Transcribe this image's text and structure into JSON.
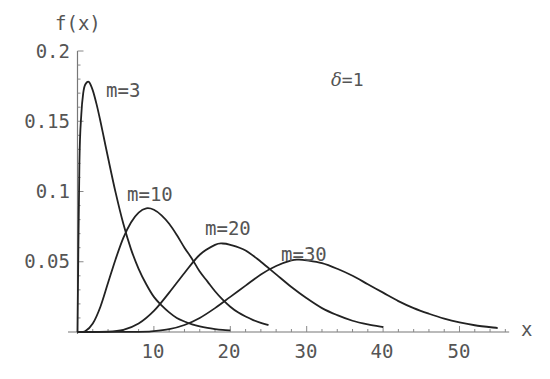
{
  "chart_data": {
    "type": "line",
    "title": "",
    "xlabel": "x",
    "ylabel": "f(x)",
    "xlim": [
      0,
      57
    ],
    "ylim": [
      0,
      0.2
    ],
    "grid": false,
    "legend": "inline curve labels",
    "x_ticks": [
      10,
      20,
      30,
      40,
      50
    ],
    "x_tick_labels": [
      "10",
      "20",
      "30",
      "40",
      "50"
    ],
    "y_ticks": [
      0.05,
      0.1,
      0.15,
      0.2
    ],
    "y_tick_labels": [
      "0.05",
      "0.1",
      "0.15",
      "0.2"
    ],
    "annotations": [
      {
        "text": "δ=1",
        "x": 36,
        "y": 0.178
      }
    ],
    "series": [
      {
        "name": "m=3",
        "label_pos": {
          "x": 3.8,
          "y": 0.172
        },
        "x": [
          0,
          0.25,
          0.5,
          0.75,
          1,
          1.5,
          2,
          2.5,
          3,
          3.5,
          4,
          5,
          6,
          7,
          8,
          9,
          10,
          11,
          12,
          13,
          14,
          15,
          16,
          17,
          18,
          19,
          20
        ],
        "values": [
          0,
          0.12,
          0.155,
          0.17,
          0.176,
          0.178,
          0.172,
          0.162,
          0.15,
          0.137,
          0.124,
          0.099,
          0.077,
          0.059,
          0.045,
          0.034,
          0.025,
          0.019,
          0.014,
          0.01,
          0.0075,
          0.0055,
          0.004,
          0.0029,
          0.0021,
          0.0015,
          0.0011
        ]
      },
      {
        "name": "m=10",
        "label_pos": {
          "x": 6.5,
          "y": 0.098
        },
        "x": [
          0,
          1,
          2,
          3,
          4,
          5,
          6,
          7,
          8,
          9,
          10,
          11,
          12,
          13,
          14,
          15,
          16,
          17,
          18,
          19,
          20,
          21,
          22,
          23,
          24,
          25
        ],
        "values": [
          0,
          0.0005,
          0.006,
          0.018,
          0.035,
          0.052,
          0.067,
          0.078,
          0.085,
          0.088,
          0.087,
          0.083,
          0.077,
          0.069,
          0.06,
          0.052,
          0.043,
          0.036,
          0.029,
          0.023,
          0.018,
          0.014,
          0.011,
          0.0085,
          0.0065,
          0.0049
        ]
      },
      {
        "name": "m=20",
        "label_pos": {
          "x": 16.8,
          "y": 0.07
        },
        "x": [
          0,
          4,
          6,
          8,
          10,
          12,
          14,
          16,
          18,
          19,
          20,
          22,
          24,
          26,
          28,
          30,
          32,
          34,
          36,
          38,
          40
        ],
        "values": [
          0,
          0.0002,
          0.0015,
          0.006,
          0.015,
          0.028,
          0.042,
          0.055,
          0.062,
          0.063,
          0.062,
          0.058,
          0.05,
          0.041,
          0.032,
          0.024,
          0.017,
          0.012,
          0.008,
          0.0054,
          0.0035
        ]
      },
      {
        "name": "m=30",
        "label_pos": {
          "x": 26.5,
          "y": 0.058
        },
        "x": [
          0,
          8,
          10,
          12,
          14,
          16,
          18,
          20,
          22,
          24,
          26,
          28,
          29,
          30,
          32,
          34,
          36,
          38,
          40,
          42,
          44,
          46,
          48,
          50,
          52,
          55
        ],
        "values": [
          0,
          0.0001,
          0.0006,
          0.002,
          0.005,
          0.01,
          0.017,
          0.025,
          0.033,
          0.041,
          0.047,
          0.051,
          0.0515,
          0.051,
          0.049,
          0.045,
          0.04,
          0.034,
          0.028,
          0.022,
          0.017,
          0.013,
          0.0095,
          0.0068,
          0.0048,
          0.0028
        ]
      }
    ]
  },
  "labels": {
    "ylabel": "f(x)",
    "xlabel": "x",
    "delta_note_symbol": "δ",
    "delta_note_value": "=1"
  }
}
